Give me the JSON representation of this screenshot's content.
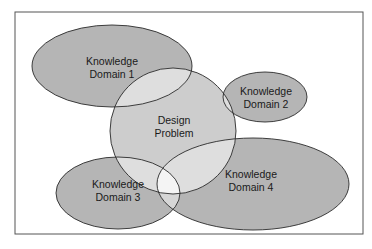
{
  "diagram": {
    "type": "venn",
    "nodes": [
      {
        "id": "domain1",
        "line1": "Knowledge",
        "line2": "Domain 1"
      },
      {
        "id": "domain2",
        "line1": "Knowledge",
        "line2": "Domain 2"
      },
      {
        "id": "design",
        "line1": "Design",
        "line2": "Problem"
      },
      {
        "id": "domain3",
        "line1": "Knowledge",
        "line2": "Domain 3"
      },
      {
        "id": "domain4",
        "line1": "Knowledge",
        "line2": "Domain 4"
      }
    ],
    "colors": {
      "domain_fill": "#b5b5b5",
      "design_fill": "#cdcdcd",
      "overlap_fill": "#dedede",
      "stroke": "#2a2a2a",
      "frame": "#555555"
    }
  }
}
